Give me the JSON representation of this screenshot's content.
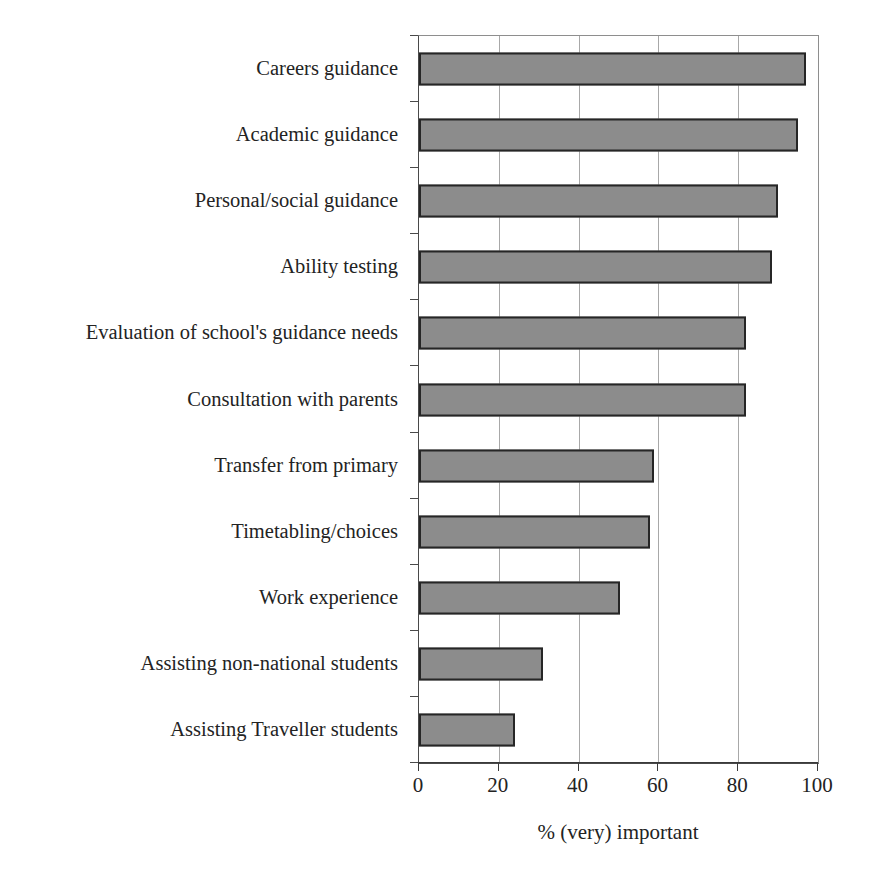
{
  "chart_data": {
    "type": "bar",
    "orientation": "horizontal",
    "title": "",
    "xlabel": "% (very) important",
    "ylabel": "",
    "xlim": [
      0,
      100
    ],
    "xticks": [
      0,
      20,
      40,
      60,
      80,
      100
    ],
    "grid": "vertical",
    "legend": "none",
    "bar_color": "#8c8c8c",
    "bar_border_color": "#262626",
    "categories": [
      "Careers guidance",
      "Academic guidance",
      "Personal/social guidance",
      "Ability testing",
      "Evaluation of school's guidance needs",
      "Consultation with parents",
      "Transfer from primary",
      "Timetabling/choices",
      "Work experience",
      "Assisting non-national students",
      "Assisting Traveller students"
    ],
    "values": [
      97,
      95,
      90,
      88.5,
      82,
      82,
      59,
      58,
      50.5,
      31,
      24
    ]
  }
}
